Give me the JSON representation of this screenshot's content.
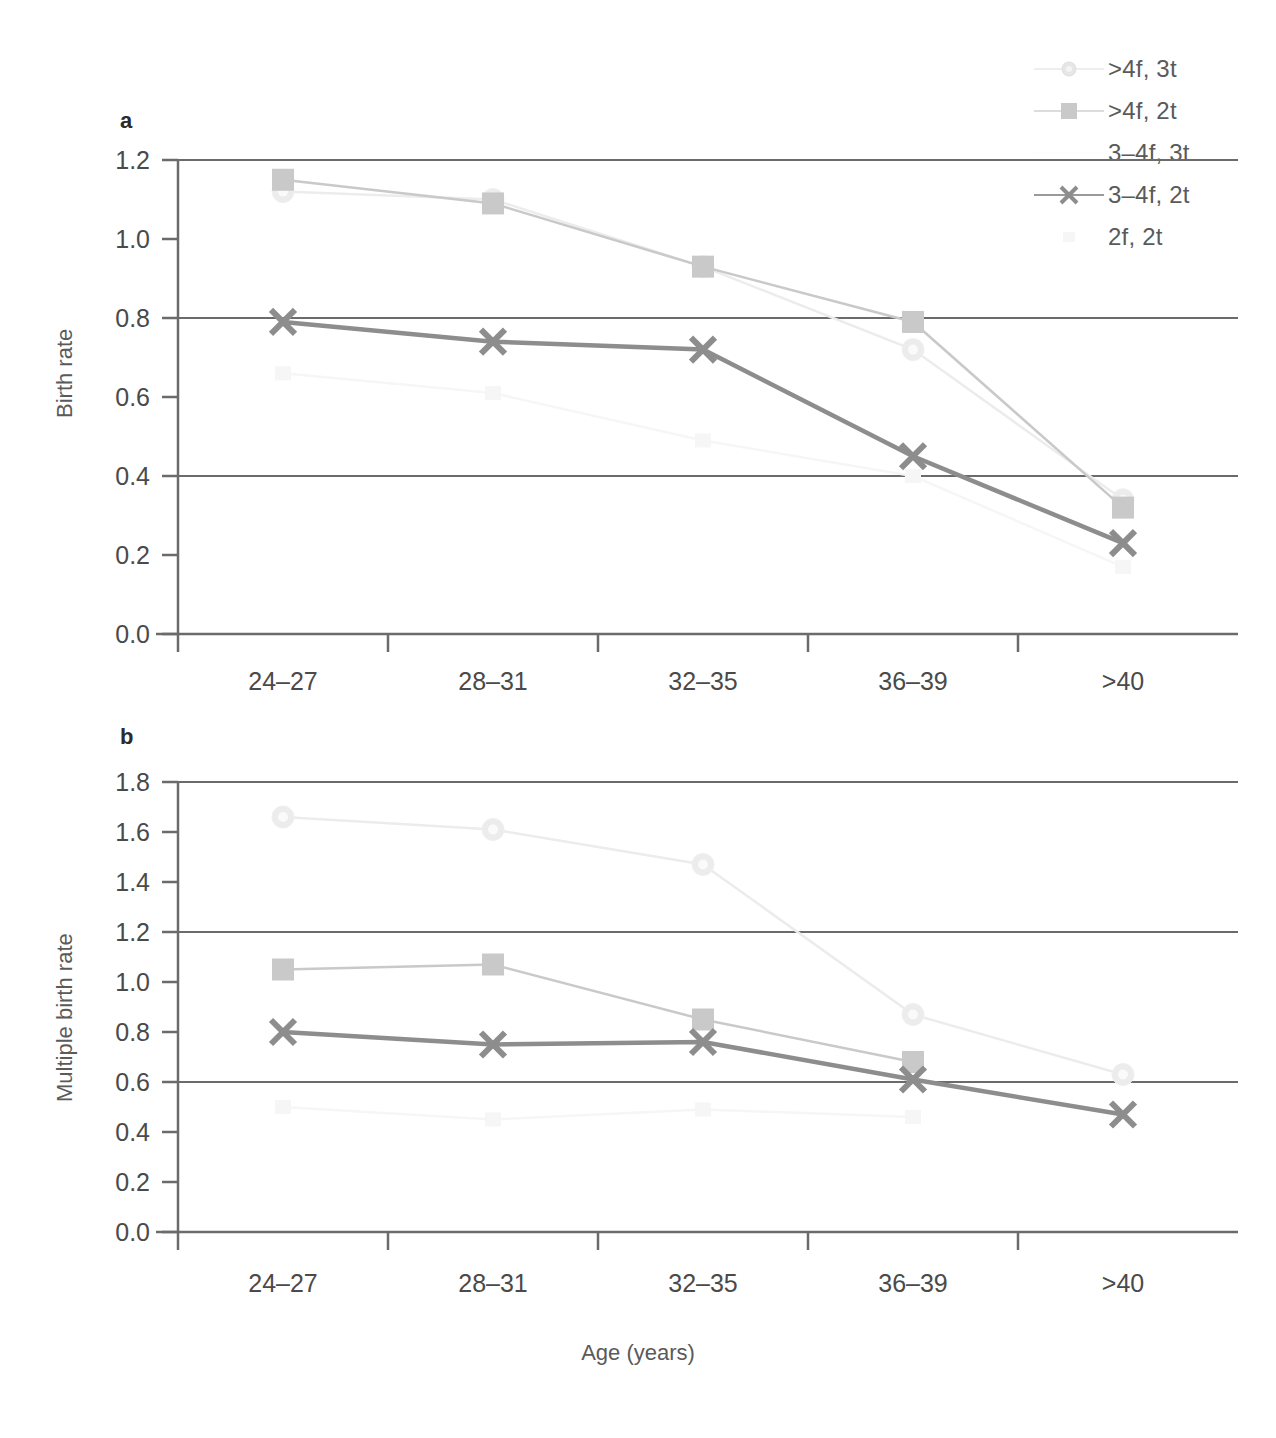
{
  "figure": {
    "xlabel": "Age (years)",
    "categories": [
      "24–27",
      "28–31",
      "32–35",
      "36–39",
      ">40"
    ],
    "panel_a_letter": "a",
    "panel_b_letter": "b"
  },
  "legend": {
    "position": "top-right",
    "entries": [
      {
        "label": ">4f, 3t",
        "marker": "circle-icon",
        "color": "#e8e8e8",
        "visible_key": true
      },
      {
        "label": ">4f, 2t",
        "marker": "square-icon",
        "color": "#c9c9c9",
        "visible_key": true
      },
      {
        "label": "3–4f, 3t",
        "marker": "none-icon",
        "color": "#fbfbfb",
        "visible_key": false
      },
      {
        "label": "3–4f, 2t",
        "marker": "cross-icon",
        "color": "#8d8d8d",
        "visible_key": true
      },
      {
        "label": "2f, 2t",
        "marker": "faint-icon",
        "color": "#f4f4f4",
        "visible_key": false
      }
    ]
  },
  "chart_data": [
    {
      "type": "line",
      "panel": "a",
      "title": "",
      "xlabel": "",
      "ylabel": "Birth rate",
      "categories": [
        "24–27",
        "28–31",
        "32–35",
        "36–39",
        ">40"
      ],
      "ylim": [
        0.0,
        1.2
      ],
      "yticks": [
        "0.0",
        "0.2",
        "0.4",
        "0.6",
        "0.8",
        "1.0",
        "1.2"
      ],
      "ytick_values": [
        0.0,
        0.2,
        0.4,
        0.6,
        0.8,
        1.0,
        1.2
      ],
      "gridlines_at": [
        0.4,
        0.8,
        1.2
      ],
      "grid": true,
      "legend_position": "outside-top-right",
      "series": [
        {
          "name": ">4f, 3t",
          "marker": "circle",
          "color": "#ececec",
          "values": [
            1.12,
            1.1,
            0.93,
            0.72,
            0.34
          ]
        },
        {
          "name": ">4f, 2t",
          "marker": "square",
          "color": "#c9c9c9",
          "values": [
            1.15,
            1.09,
            0.93,
            0.79,
            0.32
          ]
        },
        {
          "name": "3–4f, 3t",
          "marker": "none",
          "color": "#fdfdfd",
          "values": [
            null,
            null,
            null,
            null,
            null
          ]
        },
        {
          "name": "3–4f, 2t",
          "marker": "cross",
          "color": "#8d8d8d",
          "values": [
            0.79,
            0.74,
            0.72,
            0.45,
            0.23
          ]
        },
        {
          "name": "2f, 2t",
          "marker": "faint",
          "color": "#f6f6f6",
          "values": [
            0.66,
            0.61,
            0.49,
            0.4,
            0.17
          ]
        }
      ]
    },
    {
      "type": "line",
      "panel": "b",
      "title": "",
      "xlabel": "Age (years)",
      "ylabel": "Multiple birth rate",
      "categories": [
        "24–27",
        "28–31",
        "32–35",
        "36–39",
        ">40"
      ],
      "ylim": [
        0.0,
        1.8
      ],
      "yticks": [
        "0.0",
        "0.2",
        "0.4",
        "0.6",
        "0.8",
        "1.0",
        "1.2",
        "1.4",
        "1.6",
        "1.8"
      ],
      "ytick_values": [
        0.0,
        0.2,
        0.4,
        0.6,
        0.8,
        1.0,
        1.2,
        1.4,
        1.6,
        1.8
      ],
      "gridlines_at": [
        0.6,
        1.2,
        1.8
      ],
      "grid": true,
      "legend_position": "outside-top-right",
      "series": [
        {
          "name": ">4f, 3t",
          "marker": "circle",
          "color": "#ececec",
          "values": [
            1.66,
            1.61,
            1.47,
            0.87,
            0.63
          ]
        },
        {
          "name": ">4f, 2t",
          "marker": "square",
          "color": "#c9c9c9",
          "values": [
            1.05,
            1.07,
            0.85,
            0.68,
            null
          ]
        },
        {
          "name": "3–4f, 3t",
          "marker": "none",
          "color": "#fdfdfd",
          "values": [
            null,
            null,
            null,
            null,
            null
          ]
        },
        {
          "name": "3–4f, 2t",
          "marker": "cross",
          "color": "#8d8d8d",
          "values": [
            0.8,
            0.75,
            0.76,
            0.61,
            0.47
          ]
        },
        {
          "name": "2f, 2t",
          "marker": "faint",
          "color": "#f6f6f6",
          "values": [
            0.5,
            0.45,
            0.49,
            0.46,
            null
          ]
        }
      ]
    }
  ]
}
